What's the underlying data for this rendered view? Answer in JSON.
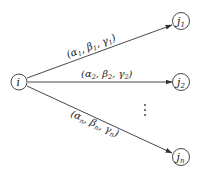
{
  "diagram": {
    "type": "directed-graph",
    "source_node": {
      "id": "i",
      "label": "i"
    },
    "target_nodes": [
      {
        "id": "j1",
        "label": "j",
        "subscript": "1"
      },
      {
        "id": "j2",
        "label": "j",
        "subscript": "2"
      },
      {
        "id": "jn",
        "label": "j",
        "subscript": "n"
      }
    ],
    "edges": [
      {
        "from": "i",
        "to": "j1",
        "label_parts": [
          "(α",
          "1",
          ", β",
          "1",
          ", γ",
          "1",
          ")"
        ]
      },
      {
        "from": "i",
        "to": "j2",
        "label_parts": [
          "(α",
          "2",
          ", β",
          "2",
          ", γ",
          "2",
          ")"
        ]
      },
      {
        "from": "i",
        "to": "jn",
        "label_parts": [
          "(α",
          "n",
          ", β",
          "n",
          ", γ",
          "n",
          ")"
        ]
      }
    ],
    "ellipsis": "⋮",
    "colors": {
      "stroke": "#333333",
      "text": "#222222",
      "background": "#ffffff"
    }
  }
}
